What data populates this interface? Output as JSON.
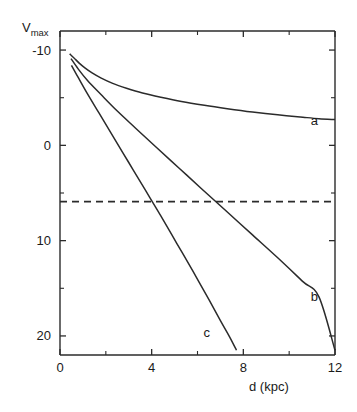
{
  "figure": {
    "background_color": "#ffffff",
    "ink_color": "#2b2b2b"
  },
  "chart_data": {
    "type": "line",
    "title": "",
    "subtitle": "",
    "xlabel": "d  (kpc)",
    "ylabel": "V",
    "ylabel_subscript": "max",
    "xlim": [
      0,
      12
    ],
    "ylim": [
      -12,
      22
    ],
    "y_axis_inverted": true,
    "grid": false,
    "legend": "inline-curve-labels",
    "xticks": [
      0,
      4,
      8,
      12
    ],
    "xtick_labels": [
      "0",
      "4",
      "8",
      "12"
    ],
    "xticks_minor": [
      2,
      6,
      10
    ],
    "yticks": [
      -10,
      0,
      10,
      20
    ],
    "ytick_labels": [
      "-10",
      "0",
      "10",
      "20"
    ],
    "yticks_minor": [
      -5,
      5,
      15
    ],
    "series": [
      {
        "name": "a",
        "label": "a",
        "label_x": 11.1,
        "label_y": -2.6,
        "points": [
          [
            0.42,
            -9.6
          ],
          [
            0.6,
            -9.2
          ],
          [
            0.85,
            -8.6
          ],
          [
            1.1,
            -8.1
          ],
          [
            1.4,
            -7.6
          ],
          [
            1.8,
            -7.05
          ],
          [
            2.3,
            -6.5
          ],
          [
            2.9,
            -6.0
          ],
          [
            3.6,
            -5.5
          ],
          [
            4.4,
            -5.05
          ],
          [
            5.3,
            -4.6
          ],
          [
            6.3,
            -4.2
          ],
          [
            7.3,
            -3.85
          ],
          [
            8.4,
            -3.5
          ],
          [
            9.5,
            -3.2
          ],
          [
            10.6,
            -2.95
          ],
          [
            11.3,
            -2.8
          ],
          [
            12.0,
            -2.7
          ]
        ]
      },
      {
        "name": "b",
        "label": "b",
        "label_x": 11.1,
        "label_y": 15.9,
        "points": [
          [
            0.48,
            -9.1
          ],
          [
            0.8,
            -8.0
          ],
          [
            1.2,
            -6.8
          ],
          [
            1.8,
            -5.3
          ],
          [
            2.5,
            -3.6
          ],
          [
            3.3,
            -1.8
          ],
          [
            4.2,
            0.2
          ],
          [
            5.2,
            2.4
          ],
          [
            6.2,
            4.6
          ],
          [
            7.3,
            7.0
          ],
          [
            8.4,
            9.4
          ],
          [
            9.5,
            11.8
          ],
          [
            10.6,
            14.3
          ],
          [
            11.3,
            15.9
          ],
          [
            12.0,
            21.5
          ]
        ]
      },
      {
        "name": "c",
        "label": "c",
        "label_x": 6.4,
        "label_y": 19.6,
        "points": [
          [
            0.5,
            -8.4
          ],
          [
            0.8,
            -7.1
          ],
          [
            1.2,
            -5.4
          ],
          [
            1.7,
            -3.4
          ],
          [
            2.3,
            -1.0
          ],
          [
            3.0,
            1.8
          ],
          [
            3.7,
            4.6
          ],
          [
            4.4,
            7.4
          ],
          [
            5.1,
            10.3
          ],
          [
            5.8,
            13.2
          ],
          [
            6.5,
            16.2
          ],
          [
            7.0,
            18.4
          ],
          [
            7.4,
            20.1
          ],
          [
            7.7,
            21.5
          ]
        ]
      }
    ],
    "threshold": {
      "name": "detection-limit",
      "style": "dashed",
      "y": 5.9,
      "x_from": 0,
      "x_to": 12
    }
  }
}
